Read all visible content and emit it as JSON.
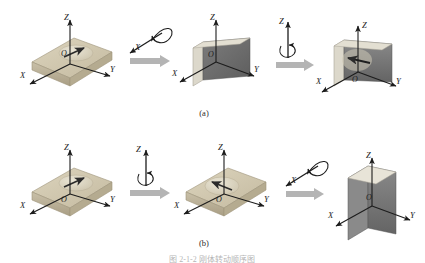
{
  "figure": {
    "background": "#ffffff",
    "caption_a": "(a)",
    "caption_b": "(b)",
    "bottom_caption": "图 2-1-2 刚体转动顺序图",
    "colors": {
      "slab_top": "#cfc6ae",
      "slab_side": "#b3a headache",
      "slab_front": "#a89c80",
      "wall_face": "#6e6e6e",
      "wall_edge": "#d9d5c8",
      "block_arrow": "#b0b0b0",
      "axis": "#1c1c1c",
      "disc": "#dcd6c4",
      "marker_arrow": "#2b2b2b"
    }
  },
  "rows": [
    {
      "id": "row-a",
      "label": "(a)",
      "steps": [
        {
          "kind": "object",
          "name": "flat-slab-initial",
          "axes": [
            "Z",
            "X",
            "Y"
          ],
          "origin": "O"
        },
        {
          "kind": "rotation",
          "name": "rotation-about-x",
          "axis_label": "X"
        },
        {
          "kind": "connector",
          "name": "block-arrow"
        },
        {
          "kind": "object",
          "name": "vertical-wall",
          "axes": [
            "Z",
            "X",
            "Y"
          ],
          "origin": "O"
        },
        {
          "kind": "rotation",
          "name": "rotation-about-z",
          "axis_label": "Z"
        },
        {
          "kind": "connector",
          "name": "block-arrow"
        },
        {
          "kind": "object",
          "name": "vertical-wall-rotated",
          "axes": [
            "Z",
            "X",
            "Y"
          ],
          "origin": "O"
        }
      ]
    },
    {
      "id": "row-b",
      "label": "(b)",
      "steps": [
        {
          "kind": "object",
          "name": "flat-slab-initial",
          "axes": [
            "Z",
            "X",
            "Y"
          ],
          "origin": "O"
        },
        {
          "kind": "rotation",
          "name": "rotation-about-z",
          "axis_label": "Z"
        },
        {
          "kind": "connector",
          "name": "block-arrow"
        },
        {
          "kind": "object",
          "name": "flat-slab-rotated",
          "axes": [
            "Z",
            "X",
            "Y"
          ],
          "origin": "O"
        },
        {
          "kind": "rotation",
          "name": "rotation-about-x",
          "axis_label": "X"
        },
        {
          "kind": "connector",
          "name": "block-arrow"
        },
        {
          "kind": "object",
          "name": "standing-block",
          "axes": [
            "Z",
            "X",
            "Y"
          ],
          "origin": "O"
        }
      ]
    }
  ],
  "labels": {
    "axis_z": "Z",
    "axis_x": "X",
    "axis_y": "Y",
    "origin": "O"
  }
}
